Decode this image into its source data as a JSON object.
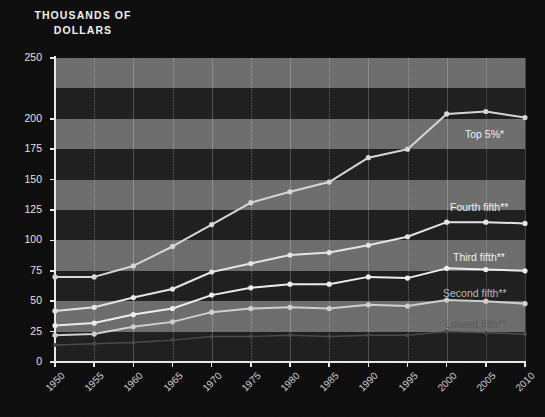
{
  "title": {
    "line1": "THOUSANDS OF",
    "line2": "DOLLARS"
  },
  "chart_data": {
    "type": "line",
    "title": "THOUSANDS OF DOLLARS",
    "xlabel": "",
    "ylabel": "THOUSANDS OF DOLLARS",
    "xlim": [
      1950,
      2010
    ],
    "ylim": [
      0,
      250
    ],
    "grid": true,
    "legend_position": "inline-right",
    "x": [
      1950,
      1955,
      1960,
      1965,
      1970,
      1975,
      1980,
      1985,
      1990,
      1995,
      2000,
      2005,
      2010
    ],
    "ytick_labels": [
      "250",
      "200",
      "175",
      "150",
      "125",
      "100",
      "75",
      "50",
      "25",
      "0"
    ],
    "ytick_values": [
      250,
      200,
      175,
      150,
      125,
      100,
      75,
      50,
      25,
      0
    ],
    "xtick_labels": [
      "1950",
      "1955",
      "1960",
      "1965",
      "1970",
      "1975",
      "1980",
      "1985",
      "1990",
      "1995",
      "2000",
      "2005",
      "2010"
    ],
    "series": [
      {
        "name": "Top 5%*",
        "label": "Top 5%*",
        "color": "#d6d6d6",
        "emphasis": "bright",
        "values": [
          70,
          70,
          79,
          95,
          113,
          131,
          140,
          148,
          168,
          175,
          204,
          206,
          201
        ]
      },
      {
        "name": "Fourth fifth**",
        "label": "Fourth fifth**",
        "color": "#e4e4e4",
        "emphasis": "bright",
        "values": [
          42,
          45,
          53,
          60,
          74,
          81,
          88,
          90,
          96,
          103,
          115,
          115,
          114
        ]
      },
      {
        "name": "Third fifth**",
        "label": "Third fifth**",
        "color": "#ededed",
        "emphasis": "bright",
        "values": [
          30,
          32,
          39,
          44,
          55,
          61,
          64,
          64,
          70,
          69,
          77,
          76,
          75
        ]
      },
      {
        "name": "Second fifth**",
        "label": "Second fifth**",
        "color": "#cfcfcf",
        "emphasis": "mid",
        "values": [
          22,
          23,
          29,
          33,
          41,
          44,
          45,
          44,
          47,
          46,
          51,
          50,
          48
        ]
      },
      {
        "name": "Lowest fifth**",
        "label": "Lowest fifth**",
        "color": "#4a4a4a",
        "emphasis": "dim",
        "values": [
          14,
          15,
          16,
          18,
          21,
          21,
          22,
          21,
          22,
          22,
          25,
          24,
          23
        ]
      }
    ]
  }
}
